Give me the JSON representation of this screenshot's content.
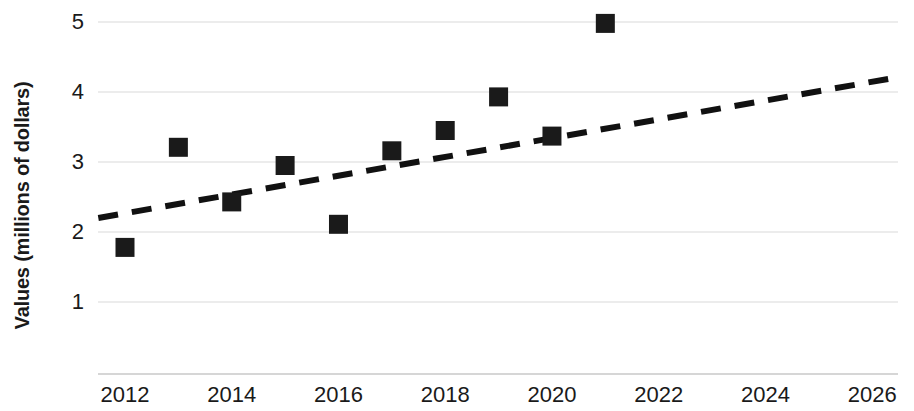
{
  "chart_data": {
    "type": "scatter",
    "title": "",
    "xlabel": "",
    "ylabel": "Values (millions of dollars)",
    "xlim": [
      2011.5,
      2026.4
    ],
    "ylim": [
      0.55,
      5.25
    ],
    "grid": true,
    "legend": false,
    "x_ticks": [
      "2012",
      "2014",
      "2016",
      "2018",
      "2020",
      "2022",
      "2024",
      "2026"
    ],
    "x_tick_values": [
      2012,
      2014,
      2016,
      2018,
      2020,
      2022,
      2024,
      2026
    ],
    "y_ticks": [
      "1",
      "2",
      "3",
      "4",
      "5"
    ],
    "y_tick_values": [
      1,
      2,
      3,
      4,
      5
    ],
    "series": [
      {
        "name": "Values",
        "marker": "square",
        "color": "#1a1a1a",
        "x": [
          2012,
          2013,
          2014,
          2015,
          2016,
          2017,
          2018,
          2019,
          2020,
          2021
        ],
        "values": [
          1.78,
          3.21,
          2.43,
          2.95,
          2.11,
          3.16,
          3.45,
          3.93,
          3.37,
          4.98
        ]
      }
    ],
    "trendline": {
      "name": "Linear trend",
      "style": "dashed",
      "color": "#111111",
      "x": [
        2011.5,
        2026.4
      ],
      "values": [
        2.2,
        4.2
      ]
    }
  }
}
